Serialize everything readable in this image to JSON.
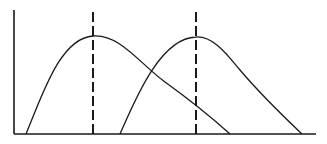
{
  "chart_data": {
    "type": "line",
    "title": "",
    "xlabel": "",
    "ylabel": "",
    "grid": false,
    "legend": null,
    "tick_labels": {
      "x": [],
      "y": []
    },
    "axis_ranges": {
      "x": [
        0,
        100
      ],
      "y": [
        0,
        100
      ]
    },
    "series": [
      {
        "name": "curve-1",
        "shape": "right-skewed unimodal",
        "start": {
          "x": 4,
          "y": 0
        },
        "peak": {
          "x": 26,
          "y": 79
        },
        "end": {
          "x": 71,
          "y": 0
        }
      },
      {
        "name": "curve-2",
        "shape": "right-skewed unimodal",
        "start": {
          "x": 35,
          "y": 0
        },
        "peak": {
          "x": 60,
          "y": 78
        },
        "end": {
          "x": 95,
          "y": 0
        }
      }
    ],
    "annotations": [
      {
        "type": "vertical-dashed-line",
        "x": 26,
        "label": "",
        "marks": "peak of curve-1"
      },
      {
        "type": "vertical-dashed-line",
        "x": 60,
        "label": "",
        "marks": "peak of curve-2"
      }
    ]
  },
  "geometry": {
    "y_axis": "M14,10 L14,134",
    "x_axis": "M14,134 L316,134",
    "curve1": "M26,134 C42,96 60,38 93,36 C120,34 140,64 165,82 C190,100 210,116 230,134",
    "curve2": "M120,134 C135,100 160,38 196,37 C214,36 228,56 240,70 C262,96 283,116 302,134",
    "mode1": "M93,12 L93,134",
    "mode2": "M196,12 L196,134"
  }
}
